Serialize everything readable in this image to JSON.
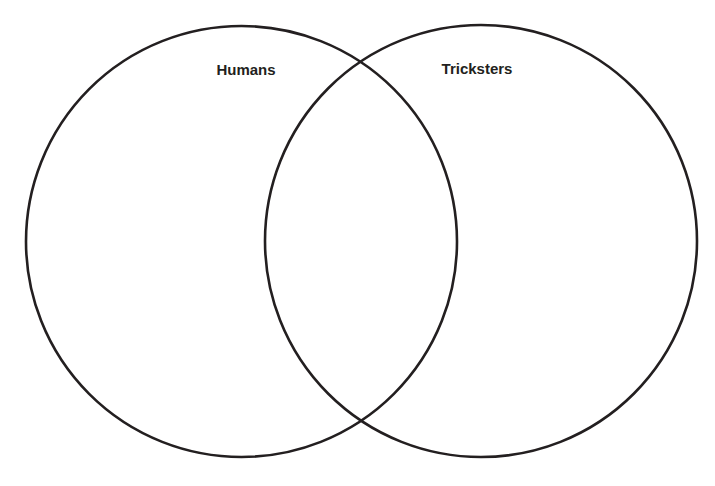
{
  "diagram": {
    "type": "venn",
    "sets": [
      {
        "id": "humans",
        "label": "Humans"
      },
      {
        "id": "tricksters",
        "label": "Tricksters"
      }
    ],
    "regions": {
      "humans_only": "",
      "intersection": "",
      "tricksters_only": ""
    },
    "colors": {
      "stroke": "#231f20",
      "text": "#231f20",
      "background": "#ffffff"
    }
  }
}
